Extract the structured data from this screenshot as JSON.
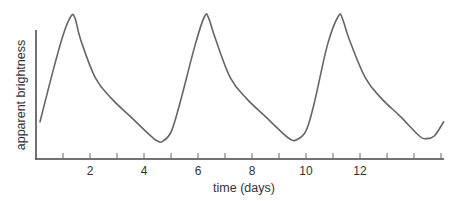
{
  "chart_data": {
    "type": "line",
    "title": "",
    "xlabel": "time (days)",
    "ylabel": "apparent brightness",
    "xlim": [
      0,
      15.2
    ],
    "ylim": [
      0,
      1
    ],
    "x_ticks": [
      1,
      2,
      3,
      4,
      5,
      6,
      7,
      8,
      9,
      10,
      11,
      12,
      13,
      14,
      15
    ],
    "x_tick_labels": [
      "2",
      "4",
      "6",
      "8",
      "10",
      "12"
    ],
    "x_tick_label_values": [
      2,
      4,
      6,
      8,
      10,
      12
    ],
    "y_ticks": [],
    "grid": false,
    "legend": null,
    "line_color": "#666666",
    "axis_color": "#444444",
    "series": [
      {
        "name": "apparent brightness",
        "x": [
          0.15,
          0.6,
          1.0,
          1.3,
          1.45,
          1.65,
          2.2,
          2.8,
          3.5,
          4.2,
          4.5,
          4.7,
          5.0,
          5.3,
          5.9,
          6.25,
          6.4,
          6.65,
          7.2,
          7.8,
          8.5,
          9.2,
          9.45,
          9.65,
          10.0,
          10.3,
          10.8,
          11.2,
          11.35,
          11.6,
          12.2,
          12.8,
          13.5,
          14.2,
          14.45,
          14.75,
          15.1
        ],
        "y": [
          0.18,
          0.55,
          0.85,
          1.0,
          0.98,
          0.82,
          0.52,
          0.36,
          0.22,
          0.08,
          0.03,
          0.03,
          0.1,
          0.3,
          0.78,
          1.0,
          0.98,
          0.82,
          0.52,
          0.36,
          0.22,
          0.08,
          0.04,
          0.04,
          0.11,
          0.32,
          0.78,
          1.0,
          0.98,
          0.82,
          0.52,
          0.36,
          0.22,
          0.07,
          0.05,
          0.07,
          0.18
        ]
      }
    ],
    "peaks_days": [
      1.3,
      6.25,
      11.2
    ],
    "minima_days": [
      4.6,
      9.55,
      14.45
    ],
    "period_days_approx": 5
  }
}
